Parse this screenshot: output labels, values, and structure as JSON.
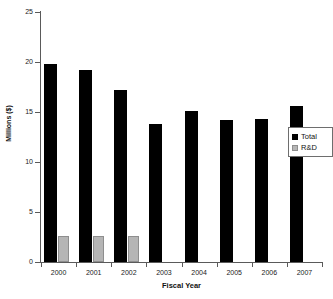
{
  "chart_data": {
    "type": "bar",
    "title": "",
    "xlabel": "Fiscal Year",
    "ylabel": "Millions ($)",
    "categories": [
      "2000",
      "2001",
      "2002",
      "2003",
      "2004",
      "2005",
      "2006",
      "2007"
    ],
    "series": [
      {
        "name": "Total",
        "color": "#000000",
        "values": [
          19.8,
          19.2,
          17.2,
          13.8,
          15.1,
          14.2,
          14.3,
          15.6
        ]
      },
      {
        "name": "R&D",
        "color": "#b5b5b5",
        "values": [
          2.6,
          2.6,
          2.65,
          null,
          null,
          null,
          null,
          null
        ]
      }
    ],
    "ylim": [
      0,
      25
    ],
    "ytick_values": [
      0,
      5,
      10,
      15,
      20,
      25
    ],
    "ytick_labels": [
      "0",
      "5",
      "10",
      "15",
      "20",
      "25"
    ],
    "grid": false,
    "legend_position": "right"
  },
  "legend": {
    "entries": [
      {
        "label": "Total",
        "swatch": "total"
      },
      {
        "label": "R&D",
        "swatch": "rd"
      }
    ]
  },
  "axes": {
    "x_title": "Fiscal Year",
    "y_title": "Millions ($)"
  }
}
